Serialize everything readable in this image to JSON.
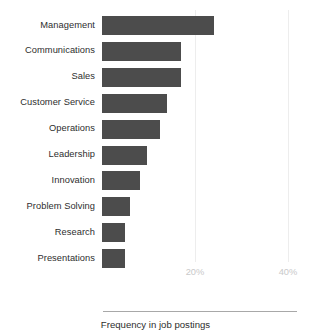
{
  "chart_data": {
    "type": "bar",
    "orientation": "horizontal",
    "title": "",
    "subtitle": "",
    "xlabel": "Frequency in job postings",
    "ylabel": "",
    "categories": [
      "Management",
      "Communications",
      "Sales",
      "Customer Service",
      "Operations",
      "Leadership",
      "Innovation",
      "Problem Solving",
      "Research",
      "Presentations"
    ],
    "values": [
      24,
      17,
      17,
      14,
      12.5,
      9.7,
      8.2,
      6,
      5,
      5
    ],
    "value_unit": "%",
    "xlim": [
      0,
      43
    ],
    "xticks": [
      20,
      40
    ],
    "xticklabels": [
      "20%",
      "40%"
    ],
    "grid": "vertical-only",
    "legend": "none",
    "bar_color": "#4c4c4c",
    "gridline_color": "#ededed",
    "tick_label_color": "#c9c9c9",
    "category_label_color": "#2e2e2e",
    "axis_line_color": "#a8a8a8",
    "background_color": "#ffffff"
  },
  "axis": {
    "caption": "Frequency in job postings"
  }
}
